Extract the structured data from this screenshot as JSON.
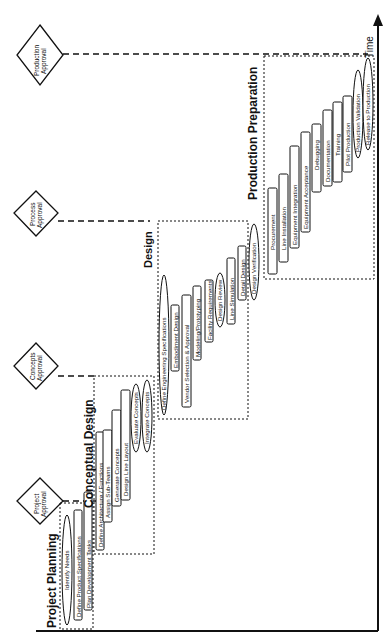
{
  "diagram": {
    "orientation": "rotated-90-ccw",
    "axis_label": "Time",
    "gates": [
      {
        "label_line1": "Project",
        "label_line2": "Approval"
      },
      {
        "label_line1": "Concepts",
        "label_line2": "Approval"
      },
      {
        "label_line1": "Process",
        "label_line2": "Approval"
      },
      {
        "label_line1": "Production",
        "label_line2": "Approval"
      }
    ],
    "phases": [
      {
        "title": "Project Planning",
        "tasks": [
          {
            "label": "Identify Needs",
            "shape": "ellipse"
          },
          {
            "label": "Define Product Specifications",
            "shape": "rect"
          },
          {
            "label": "Plan Development Tasks",
            "shape": "rect"
          }
        ]
      },
      {
        "title": "Conceptual Design",
        "tasks": [
          {
            "label": "Define Architecture / Functions",
            "shape": "rect"
          },
          {
            "label": "Assign Sub-Teams",
            "shape": "rect"
          },
          {
            "label": "Generate Concepts",
            "shape": "rect"
          },
          {
            "label": "Design Line Layout",
            "shape": "rect"
          },
          {
            "label": "Evaluate Concepts",
            "shape": "ellipse"
          },
          {
            "label": "Integrate Concepts",
            "shape": "ellipse"
          }
        ]
      },
      {
        "title": "Design",
        "tasks": [
          {
            "label": "Define Engineering Specifications",
            "shape": "ellipse"
          },
          {
            "label": "Embodiment Design",
            "shape": "rect"
          },
          {
            "label": "Vendor Selection & Approval",
            "shape": "rect"
          },
          {
            "label": "Modeling/Prototyping",
            "shape": "rect"
          },
          {
            "label": "Facility Requirements",
            "shape": "rect"
          },
          {
            "label": "Design Review",
            "shape": "ellipse"
          },
          {
            "label": "Line Simulation",
            "shape": "rect"
          },
          {
            "label": "Detail Design",
            "shape": "rect"
          },
          {
            "label": "Design Verification",
            "shape": "ellipse"
          }
        ]
      },
      {
        "title": "Production Preparation",
        "tasks": [
          {
            "label": "Procurement",
            "shape": "rect"
          },
          {
            "label": "Line Installation",
            "shape": "rect"
          },
          {
            "label": "Equipment Integration",
            "shape": "rect"
          },
          {
            "label": "Equipment Acceptance",
            "shape": "rect"
          },
          {
            "label": "Debugging",
            "shape": "rect"
          },
          {
            "label": "Documentation",
            "shape": "rect"
          },
          {
            "label": "Training",
            "shape": "rect"
          },
          {
            "label": "Pilot Production",
            "shape": "rect"
          },
          {
            "label": "Production Validation",
            "shape": "ellipse"
          },
          {
            "label": "Release to Production",
            "shape": "ellipse"
          }
        ]
      }
    ],
    "colors": {
      "line": "#111111",
      "background": "#ffffff"
    }
  }
}
